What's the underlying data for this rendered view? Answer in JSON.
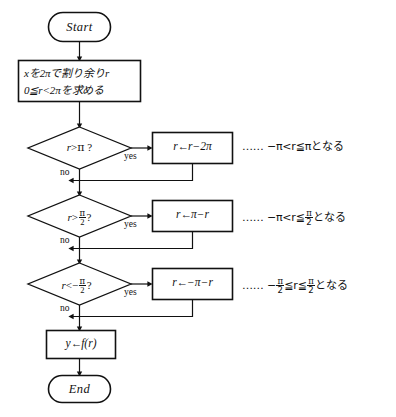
{
  "diagram": {
    "title": "",
    "type": "flowchart",
    "stroke_color": "#111111",
    "background_color": "#ffffff",
    "nodes": {
      "start": {
        "label": "Start",
        "shape": "terminal"
      },
      "process_reduce": {
        "line1": "xを2πで割り余りr",
        "line2": "0≦r<2πを求める",
        "shape": "process"
      },
      "decision1": {
        "var": "r",
        "op": ">",
        "rhs": "π",
        "question": "?",
        "shape": "decision"
      },
      "decision2": {
        "var": "r",
        "op": ">",
        "rhs_num": "π",
        "rhs_den": "2",
        "question": "?",
        "shape": "decision"
      },
      "decision3": {
        "var": "r",
        "op": "<",
        "rhs_sign": "−",
        "rhs_num": "π",
        "rhs_den": "2",
        "question": "?",
        "shape": "decision"
      },
      "action1": {
        "target": "r",
        "arrow": "←",
        "expr": "r−2π",
        "shape": "process"
      },
      "action2": {
        "target": "r",
        "arrow": "←",
        "expr": "π−r",
        "shape": "process"
      },
      "action3": {
        "target": "r",
        "arrow": "←",
        "expr": "−π−r",
        "shape": "process"
      },
      "assign_y": {
        "target": "y",
        "arrow": "←",
        "expr": "f(r)",
        "shape": "process"
      },
      "end": {
        "label": "End",
        "shape": "terminal"
      }
    },
    "branch_labels": {
      "yes": "yes",
      "no": "no"
    },
    "annotations": {
      "note1": {
        "dots": "……",
        "text_pre": "−π<r≦π",
        "text_post": "となる"
      },
      "note2": {
        "dots": "……",
        "text_pre_a": "−π<r≦",
        "frac_num": "π",
        "frac_den": "2",
        "text_post": "となる"
      },
      "note3": {
        "dots": "……",
        "sign": "−",
        "frac1_num": "π",
        "frac1_den": "2",
        "mid": "≦r≦",
        "frac2_num": "π",
        "frac2_den": "2",
        "text_post": "となる"
      }
    }
  }
}
